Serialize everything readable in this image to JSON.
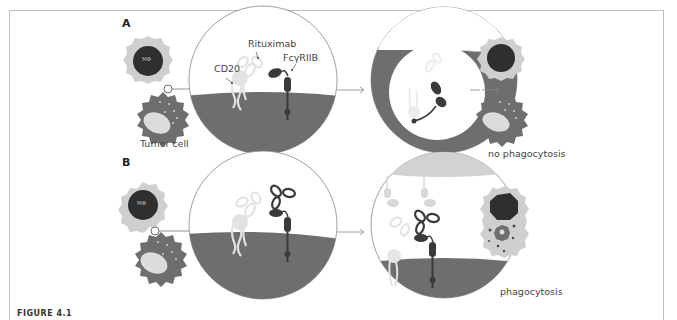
{
  "figure": {
    "panels": [
      {
        "id": "A",
        "label": "A",
        "cell_labels": {
          "macrophage": "MΦ",
          "tumor": "Tumor cell"
        },
        "zoom_labels": {
          "cd20": "CD20",
          "rituximab": "Rituximab",
          "receptor": "FcγRIIB"
        },
        "outcome": "no phagocytosis"
      },
      {
        "id": "B",
        "label": "B",
        "cell_labels": {
          "macrophage": "MΦ"
        },
        "outcome": "phagocytosis"
      }
    ],
    "caption_fragment": "FIGURE 4.1"
  },
  "colors": {
    "membrane_dark": "#6e6e6e",
    "nucleus_dark": "#2f2f2f",
    "cytoplasm_light": "#cfcfcf",
    "antibody_light": "#e2e2e2",
    "receptor_dark": "#3a3a3a",
    "frame": "#bdbdbd"
  }
}
